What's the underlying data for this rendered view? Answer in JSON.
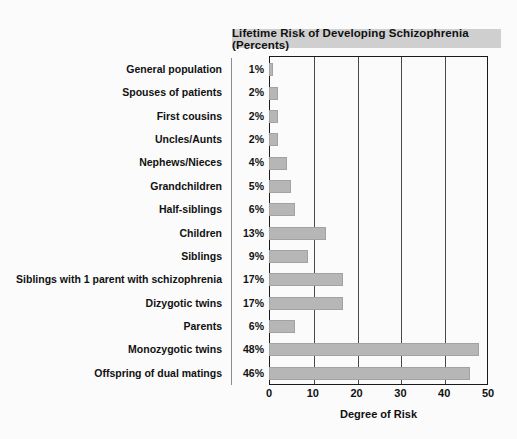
{
  "chart_data": {
    "type": "bar",
    "orientation": "horizontal",
    "title": "Lifetime Risk of Developing Schizophrenia (Percents)",
    "xlabel": "Degree of Risk",
    "ylabel": "",
    "xlim": [
      0,
      50
    ],
    "xticks": [
      0,
      10,
      20,
      30,
      40,
      50
    ],
    "grid": true,
    "legend": null,
    "categories": [
      "General population",
      "Spouses of patients",
      "First cousins",
      "Uncles/Aunts",
      "Nephews/Nieces",
      "Grandchildren",
      "Half-siblings",
      "Children",
      "Siblings",
      "Siblings with 1 parent with schizophrenia",
      "Dizygotic twins",
      "Parents",
      "Monozygotic twins",
      "Offspring of dual matings"
    ],
    "values": [
      1,
      2,
      2,
      2,
      4,
      5,
      6,
      13,
      9,
      17,
      17,
      6,
      48,
      46
    ],
    "value_labels": [
      "1%",
      "2%",
      "2%",
      "2%",
      "4%",
      "5%",
      "6%",
      "13%",
      "9%",
      "17%",
      "17%",
      "6%",
      "48%",
      "46%"
    ],
    "colors": {
      "bar_fill": "#b6b6b6",
      "bar_border": "#a2a2a2",
      "title_background": "#cfcfcf",
      "axis": "#1a1a1a",
      "gridline": "#4a4a4a",
      "text": "#111111",
      "page_background": "#fbfbfb"
    }
  }
}
